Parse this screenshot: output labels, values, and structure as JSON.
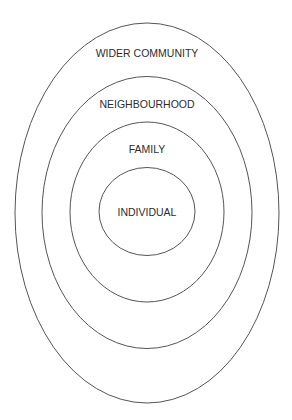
{
  "diagram": {
    "type": "nested-ellipses",
    "stroke_color": "#555555",
    "text_color": "#2e2e2e",
    "background": "#ffffff",
    "layers": [
      {
        "label": "WIDER COMMUNITY",
        "level": 4
      },
      {
        "label": "NEIGHBOURHOOD",
        "level": 3
      },
      {
        "label": "FAMILY",
        "level": 2
      },
      {
        "label": "INDIVIDUAL",
        "level": 1
      }
    ]
  }
}
